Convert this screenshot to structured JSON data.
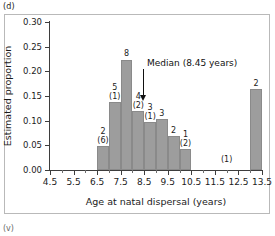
{
  "panel_tag": "(d)",
  "bottom_tag": "(v)",
  "chart_data": {
    "type": "bar",
    "title": "",
    "xlabel": "Age at natal dispersal (years)",
    "ylabel": "Estimated proportion",
    "xlim": [
      4.5,
      13.5
    ],
    "ylim": [
      0.0,
      0.3
    ],
    "grid": false,
    "legend": null,
    "bin_width": 0.5,
    "xticks": [
      "4.5",
      "5.5",
      "6.5",
      "7.5",
      "8.5",
      "9.5",
      "10.5",
      "11.5",
      "12.5",
      "13.5"
    ],
    "xtick_values": [
      4.5,
      5.5,
      6.5,
      7.5,
      8.5,
      9.5,
      10.5,
      11.5,
      12.5,
      13.5
    ],
    "xtick_minor_values": [
      5.0,
      6.0,
      7.0,
      8.0,
      9.0,
      10.0,
      11.0,
      12.0,
      13.0
    ],
    "yticks": [
      "0.00",
      "0.05",
      "0.10",
      "0.15",
      "0.20",
      "0.25",
      "0.30"
    ],
    "ytick_values": [
      0.0,
      0.05,
      0.1,
      0.15,
      0.2,
      0.25,
      0.3
    ],
    "categories": [
      "6.5-7.0",
      "7.0-7.5",
      "7.5-8.0",
      "8.0-8.5",
      "8.5-9.0",
      "9.0-9.5",
      "9.5-10.0",
      "10.0-10.5",
      "13.0-13.5"
    ],
    "bin_starts": [
      6.5,
      7.0,
      7.5,
      8.0,
      8.5,
      9.0,
      9.5,
      10.0,
      13.0
    ],
    "values": [
      0.049,
      0.138,
      0.224,
      0.119,
      0.098,
      0.103,
      0.068,
      0.042,
      0.165
    ],
    "bar_labels": [
      "2",
      "5",
      "8",
      "4",
      "3",
      "3",
      "2",
      "1",
      "2"
    ],
    "bar_sublabels": [
      "(6)",
      "(1)",
      "",
      "(2)",
      "(1)",
      "",
      "",
      "(2)",
      ""
    ],
    "ghost_labels": [
      {
        "text": "(1)",
        "x": 12.0,
        "y": 0.012
      }
    ],
    "annotations": [
      {
        "name": "median",
        "text": "Median (8.45 years)",
        "x": 8.45,
        "arrow_top_y": 0.205,
        "arrow_bottom_y": 0.139
      }
    ]
  }
}
